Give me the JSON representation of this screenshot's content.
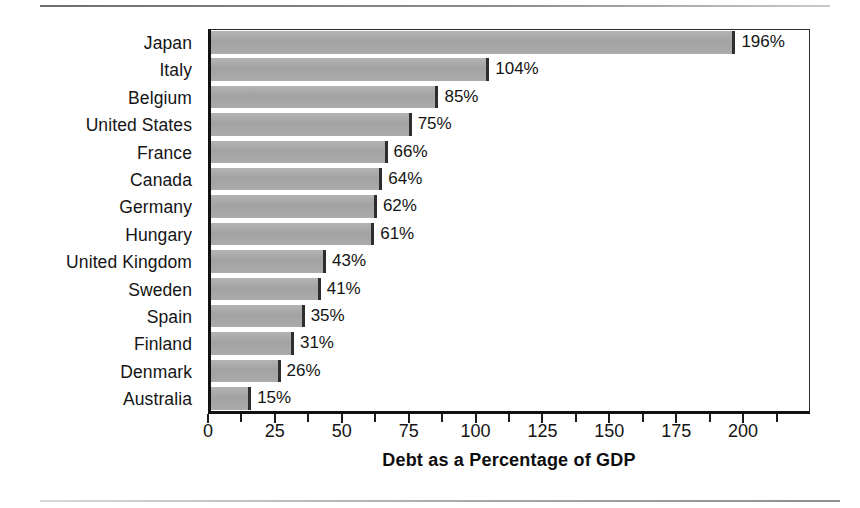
{
  "chart_data": {
    "type": "bar",
    "orientation": "horizontal",
    "title": "",
    "xlabel": "Debt as a Percentage of GDP",
    "ylabel": "",
    "categories": [
      "Japan",
      "Italy",
      "Belgium",
      "United States",
      "France",
      "Canada",
      "Germany",
      "Hungary",
      "United Kingdom",
      "Sweden",
      "Spain",
      "Finland",
      "Denmark",
      "Australia"
    ],
    "values": [
      196,
      104,
      85,
      75,
      66,
      64,
      62,
      61,
      43,
      41,
      35,
      31,
      26,
      15
    ],
    "value_labels": [
      "196%",
      "104%",
      "85%",
      "75%",
      "66%",
      "64%",
      "62%",
      "61%",
      "43%",
      "41%",
      "35%",
      "31%",
      "26%",
      "15%"
    ],
    "xlim": [
      0,
      225
    ],
    "xticks": [
      0,
      25,
      50,
      75,
      100,
      125,
      150,
      175,
      200
    ],
    "xtick_labels": [
      "0",
      "25",
      "50",
      "75",
      "100",
      "125",
      "150",
      "175",
      "200"
    ],
    "minor_xticks": [
      12.5,
      37.5,
      62.5,
      87.5,
      112.5,
      137.5,
      162.5,
      187.5,
      212.5
    ],
    "grid": false,
    "legend": false,
    "bar_color": "#a8a8a8",
    "bar_edge_color": "#2e2e2e",
    "axis_color": "#111111"
  }
}
